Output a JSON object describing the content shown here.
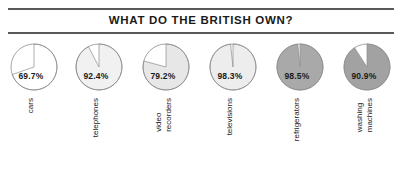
{
  "figure": {
    "title": "WHAT DO THE BRITISH OWN?",
    "background_color": "#ffffff",
    "rule_color": "#58585a",
    "text_color": "#1a1a1a"
  },
  "chart_data": {
    "type": "pie",
    "title": "WHAT DO THE BRITISH OWN?",
    "xlabel": "",
    "ylabel": "",
    "units": "percent",
    "legend": "none",
    "grid": false,
    "note": "Six separate single-value pie charts; each pie shows the percentage of British households owning the item, with the remainder drawn as an unfilled white wedge.",
    "categories": [
      "cars",
      "telephones",
      "video recorders",
      "televisions",
      "refrigerators",
      "washing machines"
    ],
    "values": [
      69.7,
      92.4,
      79.2,
      98.3,
      98.5,
      90.9
    ],
    "value_labels": [
      "69.7%",
      "92.4%",
      "79.2%",
      "98.3%",
      "98.5%",
      "90.9%"
    ],
    "slice_colors": [
      "#ffffff",
      "#f1f1f1",
      "#e7e7e7",
      "#ededed",
      "#a9a9a9",
      "#a2a2a2"
    ],
    "remainder_color": "#ffffff",
    "outline_color": "#8d8d8d"
  },
  "pies": [
    {
      "id": "cars",
      "label_lines": [
        "cars"
      ],
      "value": 69.7,
      "value_label": "69.7%",
      "fill": "#ffffff",
      "outline": "#8d8d8d",
      "cx": 31,
      "cy": 27,
      "r": 23
    },
    {
      "id": "telephones",
      "label_lines": [
        "telephones"
      ],
      "value": 92.4,
      "value_label": "92.4%",
      "fill": "#f1f1f1",
      "outline": "#8d8d8d",
      "cx": 31,
      "cy": 27,
      "r": 23
    },
    {
      "id": "video-recorders",
      "label_lines": [
        "video",
        "recorders"
      ],
      "value": 79.2,
      "value_label": "79.2%",
      "fill": "#e7e7e7",
      "outline": "#8d8d8d",
      "cx": 31,
      "cy": 27,
      "r": 23
    },
    {
      "id": "televisions",
      "label_lines": [
        "televisions"
      ],
      "value": 98.3,
      "value_label": "98.3%",
      "fill": "#ededed",
      "outline": "#8d8d8d",
      "cx": 31,
      "cy": 27,
      "r": 23
    },
    {
      "id": "refrigerators",
      "label_lines": [
        "refrigerators"
      ],
      "value": 98.5,
      "value_label": "98.5%",
      "fill": "#a9a9a9",
      "outline": "#8d8d8d",
      "cx": 31,
      "cy": 27,
      "r": 23
    },
    {
      "id": "washing-machines",
      "label_lines": [
        "washing",
        "machines"
      ],
      "value": 90.9,
      "value_label": "90.9%",
      "fill": "#a2a2a2",
      "outline": "#8d8d8d",
      "cx": 31,
      "cy": 27,
      "r": 23
    }
  ],
  "layout": {
    "pie_left_positions": [
      3,
      68,
      135,
      202,
      269,
      336
    ]
  }
}
